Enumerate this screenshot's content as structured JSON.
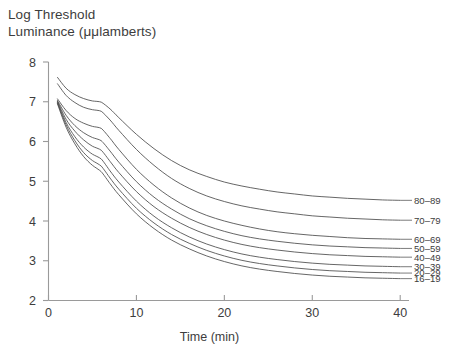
{
  "chart_data": {
    "type": "line",
    "title": "",
    "ylabel": "Log Threshold Luminance (μμlamberts)",
    "ylabel_line1": "Log Threshold",
    "ylabel_line2": "Luminance (μμlamberts)",
    "xlabel": "Time (min)",
    "xlim": [
      0,
      41
    ],
    "ylim": [
      2,
      8
    ],
    "xticks": [
      0,
      10,
      20,
      30,
      40
    ],
    "yticks": [
      2,
      3,
      4,
      5,
      6,
      7,
      8
    ],
    "grid": false,
    "legend_position": "right-inline-labels",
    "line_color": "#4a4a4a",
    "axis_color": "#9a9a9a",
    "text_color": "#3d3d3d",
    "x": [
      1,
      2,
      3,
      4,
      5,
      6,
      7,
      8,
      10,
      12,
      14,
      16,
      18,
      20,
      22,
      24,
      26,
      28,
      30,
      32,
      34,
      36,
      38,
      40
    ],
    "series": [
      {
        "name": "80-89",
        "label": "80–89",
        "values": [
          7.62,
          7.34,
          7.18,
          7.08,
          7.02,
          6.99,
          6.82,
          6.6,
          6.18,
          5.82,
          5.52,
          5.29,
          5.12,
          4.98,
          4.88,
          4.8,
          4.73,
          4.68,
          4.63,
          4.6,
          4.57,
          4.55,
          4.53,
          4.52
        ]
      },
      {
        "name": "70-79",
        "label": "70–79",
        "values": [
          7.46,
          7.16,
          6.98,
          6.86,
          6.8,
          6.76,
          6.54,
          6.28,
          5.8,
          5.4,
          5.07,
          4.82,
          4.63,
          4.49,
          4.38,
          4.3,
          4.23,
          4.18,
          4.13,
          4.1,
          4.07,
          4.05,
          4.03,
          4.02
        ]
      },
      {
        "name": "60-69",
        "label": "60–69",
        "values": [
          7.08,
          6.78,
          6.58,
          6.46,
          6.38,
          6.33,
          6.08,
          5.8,
          5.3,
          4.9,
          4.58,
          4.33,
          4.14,
          4.0,
          3.89,
          3.8,
          3.73,
          3.68,
          3.64,
          3.61,
          3.58,
          3.56,
          3.55,
          3.54
        ]
      },
      {
        "name": "50-59",
        "label": "50–59",
        "values": [
          7.04,
          6.66,
          6.4,
          6.22,
          6.1,
          6.02,
          5.76,
          5.48,
          4.99,
          4.6,
          4.3,
          4.06,
          3.88,
          3.74,
          3.63,
          3.55,
          3.49,
          3.44,
          3.4,
          3.37,
          3.35,
          3.33,
          3.32,
          3.31
        ]
      },
      {
        "name": "40-49",
        "label": "40–49",
        "values": [
          7.02,
          6.56,
          6.26,
          6.04,
          5.88,
          5.78,
          5.5,
          5.22,
          4.74,
          4.36,
          4.07,
          3.84,
          3.66,
          3.52,
          3.41,
          3.33,
          3.27,
          3.22,
          3.18,
          3.15,
          3.13,
          3.11,
          3.1,
          3.09
        ]
      },
      {
        "name": "30-39",
        "label": "30–39",
        "values": [
          7.0,
          6.48,
          6.12,
          5.86,
          5.68,
          5.56,
          5.26,
          4.98,
          4.5,
          4.12,
          3.83,
          3.6,
          3.42,
          3.28,
          3.17,
          3.09,
          3.03,
          2.98,
          2.94,
          2.91,
          2.89,
          2.87,
          2.86,
          2.85
        ]
      },
      {
        "name": "20-29",
        "label": "20–29",
        "values": [
          6.98,
          6.42,
          6.02,
          5.72,
          5.52,
          5.38,
          5.08,
          4.8,
          4.32,
          3.95,
          3.66,
          3.44,
          3.26,
          3.12,
          3.01,
          2.93,
          2.87,
          2.82,
          2.78,
          2.75,
          2.73,
          2.71,
          2.7,
          2.69
        ]
      },
      {
        "name": "16-19",
        "label": "16–19",
        "values": [
          6.96,
          6.36,
          5.94,
          5.62,
          5.4,
          5.24,
          4.94,
          4.66,
          4.18,
          3.81,
          3.52,
          3.3,
          3.12,
          2.98,
          2.87,
          2.79,
          2.73,
          2.68,
          2.64,
          2.61,
          2.59,
          2.57,
          2.56,
          2.55
        ]
      }
    ],
    "legend_labels": [
      "80–89",
      "70–79",
      "60–69",
      "50–59",
      "40–49",
      "30–39",
      "20–29",
      "16–19"
    ],
    "legend_label_y": [
      4.52,
      4.02,
      3.54,
      3.31,
      3.09,
      2.85,
      2.69,
      2.55
    ]
  }
}
